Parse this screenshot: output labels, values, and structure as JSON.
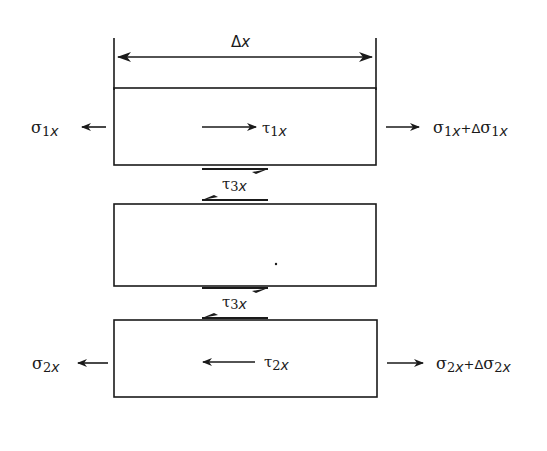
{
  "diagram": {
    "type": "free-body diagram of layered element",
    "dimension": {
      "label": "Δx",
      "symbol": "Δ",
      "var": "x"
    },
    "layers": [
      {
        "id": "layer-1",
        "left_stress": {
          "sym": "σ",
          "sub": "1",
          "var": "x"
        },
        "shear": {
          "sym": "τ",
          "sub": "1",
          "var": "x",
          "direction": "right"
        },
        "right_stress": {
          "sym": "σ",
          "sub": "1",
          "var": "x",
          "plus": "+Δ",
          "sym2": "σ",
          "sub2": "1",
          "var2": "x"
        }
      },
      {
        "id": "layer-3",
        "interface_shear": {
          "sym": "τ",
          "sub": "3",
          "var": "x"
        }
      },
      {
        "id": "layer-2",
        "left_stress": {
          "sym": "σ",
          "sub": "2",
          "var": "x"
        },
        "shear": {
          "sym": "τ",
          "sub": "2",
          "var": "x",
          "direction": "left"
        },
        "right_stress": {
          "sym": "σ",
          "sub": "2",
          "var": "x",
          "plus": "+Δ",
          "sym2": "σ",
          "sub2": "2",
          "var2": "x"
        }
      }
    ],
    "colors": {
      "ink": "#1a1a1a",
      "background": "#ffffff"
    }
  }
}
